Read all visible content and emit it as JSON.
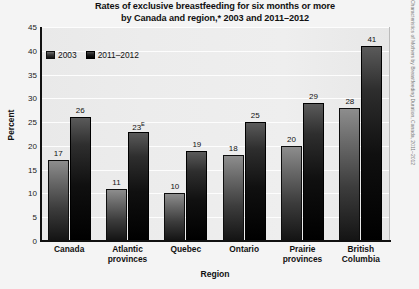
{
  "chart_data": {
    "type": "bar",
    "title": "Rates of exclusive breastfeeding for six months or more by Canada and region,* 2003 and 2011–2012",
    "title_line1": "Rates of exclusive breastfeeding for six months or more",
    "title_line2": "by Canada and region,* 2003 and 2011–2012",
    "xlabel": "Region",
    "ylabel": "Percent",
    "ylim": [
      0,
      45
    ],
    "yticks": [
      0,
      5,
      10,
      15,
      20,
      25,
      30,
      35,
      40,
      45
    ],
    "grid": true,
    "legend_position": "top-left",
    "categories": [
      "Canada",
      "Atlantic provinces",
      "Quebec",
      "Ontario",
      "Prairie provinces",
      "British Columbia"
    ],
    "categories_wrapped": [
      [
        "Canada"
      ],
      [
        "Atlantic",
        "provinces"
      ],
      [
        "Quebec"
      ],
      [
        "Ontario"
      ],
      [
        "Prairie",
        "provinces"
      ],
      [
        "British",
        "Columbia"
      ]
    ],
    "series": [
      {
        "name": "2003",
        "color": "#2b2b2b",
        "values": [
          17,
          11,
          10,
          18,
          20,
          28
        ],
        "labels": [
          "17",
          "11",
          "10",
          "18",
          "20",
          "28"
        ],
        "flags": [
          "",
          "",
          "",
          "",
          "",
          ""
        ]
      },
      {
        "name": "2011–2012",
        "color": "#000000",
        "values": [
          26,
          23,
          19,
          25,
          29,
          41
        ],
        "labels": [
          "26",
          "23",
          "19",
          "25",
          "29",
          "41"
        ],
        "flags": [
          "",
          "E",
          "",
          "",
          "",
          ""
        ]
      }
    ],
    "footnote_symbols": [
      "*",
      "E"
    ],
    "source_note": "Characteristics of Mothers by Breastfeeding Duration, Canada, 2011–2012"
  }
}
